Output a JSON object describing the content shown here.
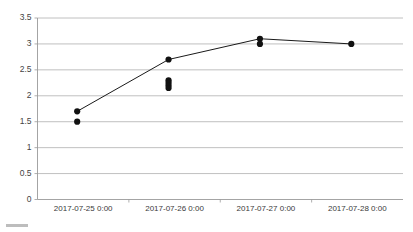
{
  "chart_data": {
    "type": "line",
    "title": "",
    "subtitle": "",
    "xlabel": "",
    "ylabel": "",
    "grid": true,
    "legend_position": "bottom-left",
    "legend_entries": [],
    "ylim": [
      0,
      3.5
    ],
    "ytick_labels": [
      "0",
      "0.5",
      "1",
      "1.5",
      "2",
      "2.5",
      "3",
      "3.5"
    ],
    "ytick_values": [
      0,
      0.5,
      1,
      1.5,
      2,
      2.5,
      3,
      3.5
    ],
    "xtick_labels": [
      "2017-07-25 0:00",
      "2017-07-26 0:00",
      "2017-07-27 0:00",
      "2017-07-28 0:00"
    ],
    "categories": [
      "2017-07-25 0:00",
      "2017-07-26 0:00",
      "2017-07-27 0:00",
      "2017-07-28 0:00"
    ],
    "series": [
      {
        "name": "series-1",
        "values": [
          1.7,
          2.7,
          3.1,
          3.0
        ]
      }
    ],
    "scatter_points": [
      {
        "x_index": 0,
        "values": [
          1.7,
          1.5
        ]
      },
      {
        "x_index": 1,
        "values": [
          2.7,
          2.3,
          2.25,
          2.2,
          2.15
        ]
      },
      {
        "x_index": 2,
        "values": [
          3.1,
          3.0
        ]
      },
      {
        "x_index": 3,
        "values": [
          3.0
        ]
      }
    ],
    "colors": {
      "line": "#1a1a1a",
      "marker": "#111111",
      "gridline": "#b0b0b0",
      "axis": "#9a9a9a",
      "tick_text": "#3a3a3a",
      "background": "#ffffff",
      "legend_swatch": "#bdbdbd"
    }
  }
}
